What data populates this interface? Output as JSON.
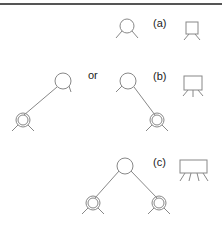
{
  "diagram": {
    "type": "tree-node-notation",
    "rows": [
      {
        "id": "a",
        "label": "(a)",
        "node_glyph": "single-node",
        "box_glyph": "box-two-legs"
      },
      {
        "id": "b",
        "label": "(b)",
        "connector": "or",
        "left_variant": "root-with-left-child",
        "right_variant": "root-with-right-child",
        "box_glyph": "box-three-legs"
      },
      {
        "id": "c",
        "label": "(c)",
        "variant": "root-with-two-children",
        "box_glyph": "box-four-legs"
      }
    ],
    "colors": {
      "stroke": "#888888",
      "text": "#222222",
      "rule": "#555555"
    }
  }
}
